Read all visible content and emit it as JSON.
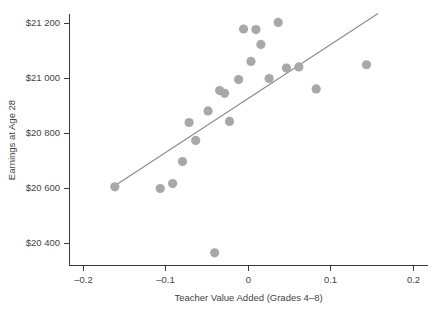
{
  "chart_data": {
    "type": "scatter",
    "title": "",
    "xlabel": "Teacher Value Added (Grades 4–8)",
    "ylabel": "Earnings at Age 28",
    "xlim": [
      -0.24,
      0.22
    ],
    "ylim": [
      20320,
      21260
    ],
    "grid": false,
    "legend": "none",
    "xticks": [
      -0.2,
      -0.1,
      0,
      0.1,
      0.2
    ],
    "xtick_labels": [
      "–0.2",
      "–0.1",
      "0",
      "0.1",
      "0.2"
    ],
    "yticks": [
      20400,
      20600,
      20800,
      21000,
      21200
    ],
    "ytick_labels": [
      "$20 400",
      "$20 600",
      "$20 800",
      "$21 000",
      "$21 200"
    ],
    "marker": {
      "shape": "circle",
      "color": "#a8a8a8",
      "size": 4.6
    },
    "points": [
      {
        "x": -0.162,
        "y": 20606
      },
      {
        "x": -0.107,
        "y": 20600
      },
      {
        "x": -0.092,
        "y": 20618
      },
      {
        "x": -0.08,
        "y": 20698
      },
      {
        "x": -0.072,
        "y": 20840
      },
      {
        "x": -0.064,
        "y": 20775
      },
      {
        "x": -0.049,
        "y": 20882
      },
      {
        "x": -0.041,
        "y": 20366
      },
      {
        "x": -0.035,
        "y": 20956
      },
      {
        "x": -0.029,
        "y": 20946
      },
      {
        "x": -0.023,
        "y": 20844
      },
      {
        "x": -0.012,
        "y": 20996
      },
      {
        "x": -0.006,
        "y": 21180
      },
      {
        "x": 0.003,
        "y": 21062
      },
      {
        "x": 0.009,
        "y": 21178
      },
      {
        "x": 0.015,
        "y": 21124
      },
      {
        "x": 0.025,
        "y": 21000
      },
      {
        "x": 0.036,
        "y": 21204
      },
      {
        "x": 0.046,
        "y": 21038
      },
      {
        "x": 0.061,
        "y": 21042
      },
      {
        "x": 0.082,
        "y": 20962
      },
      {
        "x": 0.143,
        "y": 21050
      }
    ],
    "fit_line": {
      "type": "linear",
      "x_start": -0.163,
      "y_start": 20608,
      "x_end": 0.157,
      "y_end": 21236
    }
  }
}
